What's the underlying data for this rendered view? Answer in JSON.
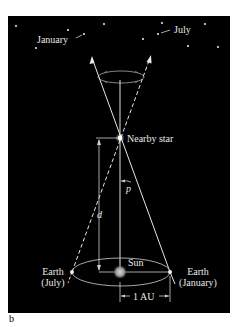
{
  "figure": {
    "panel_label": "b",
    "background": "#000000",
    "foreground": "#e8e8e8"
  },
  "labels": {
    "january_star": "January",
    "july_star": "July",
    "nearby_star": "Nearby star",
    "parallax_angle": "p",
    "distance": "d",
    "sun": "Sun",
    "earth_july_line1": "Earth",
    "earth_july_line2": "(July)",
    "earth_january_line1": "Earth",
    "earth_january_line2": "(January)",
    "au_scale": "1 AU"
  },
  "background_stars": [
    {
      "x": 16,
      "y": 26
    },
    {
      "x": 68,
      "y": 30
    },
    {
      "x": 84,
      "y": 34
    },
    {
      "x": 104,
      "y": 24
    },
    {
      "x": 36,
      "y": 48
    },
    {
      "x": 143,
      "y": 39
    },
    {
      "x": 158,
      "y": 34
    },
    {
      "x": 162,
      "y": 23
    },
    {
      "x": 188,
      "y": 46
    },
    {
      "x": 205,
      "y": 24
    },
    {
      "x": 218,
      "y": 47
    }
  ]
}
